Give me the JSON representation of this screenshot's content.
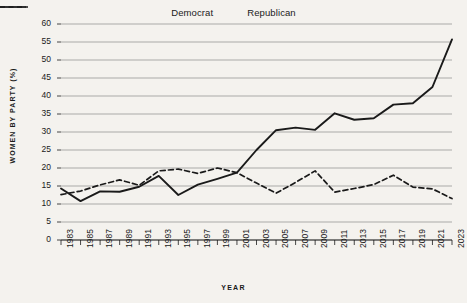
{
  "chart_data": {
    "type": "line",
    "title": "",
    "xlabel": "YEAR",
    "ylabel": "WOMEN BY PARTY (%)",
    "xlim": [
      1983,
      2023
    ],
    "ylim": [
      0,
      60
    ],
    "yticks": [
      0,
      5,
      10,
      15,
      20,
      25,
      30,
      35,
      40,
      45,
      50,
      55,
      60
    ],
    "grid": true,
    "legend_position": "top-center",
    "x": [
      1983,
      1985,
      1987,
      1989,
      1991,
      1993,
      1995,
      1997,
      1999,
      2001,
      2003,
      2005,
      2007,
      2009,
      2011,
      2013,
      2015,
      2017,
      2019,
      2021,
      2023
    ],
    "categories": [
      "1983",
      "1985",
      "1987",
      "1989",
      "1991",
      "1993",
      "1995",
      "1997",
      "1999",
      "2001",
      "2003",
      "2005",
      "2007",
      "2009",
      "2011",
      "2013",
      "2015",
      "2017",
      "2019",
      "2021",
      "2023"
    ],
    "series": [
      {
        "name": "Democrat",
        "style": "solid",
        "color": "#1a1a1a",
        "values": [
          14.3,
          10.8,
          13.5,
          13.4,
          14.8,
          17.8,
          12.5,
          15.4,
          17.0,
          18.7,
          25.0,
          30.5,
          31.2,
          30.6,
          35.2,
          33.4,
          33.8,
          37.6,
          38.0,
          42.5,
          55.7
        ]
      },
      {
        "name": "Republican",
        "style": "dashed",
        "color": "#1a1a1a",
        "values": [
          12.6,
          13.6,
          15.3,
          16.7,
          15.2,
          19.2,
          19.7,
          18.5,
          20.0,
          18.7,
          15.8,
          13.0,
          16.0,
          19.2,
          13.3,
          14.3,
          15.4,
          18.0,
          14.7,
          14.2,
          11.5
        ]
      }
    ]
  },
  "legend": {
    "items": [
      {
        "label": "Democrat",
        "style": "solid"
      },
      {
        "label": "Republican",
        "style": "dashed"
      }
    ]
  }
}
